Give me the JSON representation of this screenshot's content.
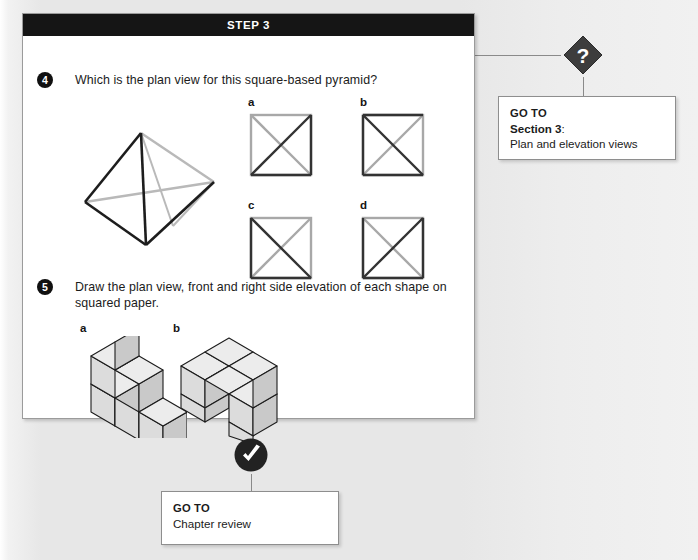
{
  "page": {
    "background_color": "#e9e9e9"
  },
  "step_panel": {
    "header_title": "STEP 3",
    "header_bg": "#151515",
    "body_bg": "#ffffff"
  },
  "questions": [
    {
      "number": "4",
      "text": "Which is the plan view for this square-based pyramid?",
      "figure": "square-based-pyramid-wireframe",
      "options": [
        {
          "letter": "a",
          "figure": "square-with-x-diagonals"
        },
        {
          "letter": "b",
          "figure": "square-with-x-diagonals"
        },
        {
          "letter": "c",
          "figure": "square-with-x-diagonals"
        },
        {
          "letter": "d",
          "figure": "square-with-x-diagonals"
        }
      ]
    },
    {
      "number": "5",
      "text": "Draw the plan view, front and right side elevation of each shape on squared paper.",
      "options": [
        {
          "letter": "a",
          "figure": "cube-stack-staircase"
        },
        {
          "letter": "b",
          "figure": "cube-stack-l-shape"
        }
      ]
    }
  ],
  "goto_boxes": [
    {
      "badge": "question-mark-diamond",
      "badge_glyph": "?",
      "badge_color": "#3d3d3d",
      "label": "GO TO",
      "target_bold": "Section 3",
      "target_suffix": ":",
      "target_description": "Plan and elevation views"
    },
    {
      "badge": "checkmark-circle",
      "badge_glyph": "✓",
      "badge_color": "#222222",
      "label": "GO TO",
      "target_description": "Chapter review"
    }
  ],
  "connectors": {
    "color": "#8a8a8a"
  }
}
